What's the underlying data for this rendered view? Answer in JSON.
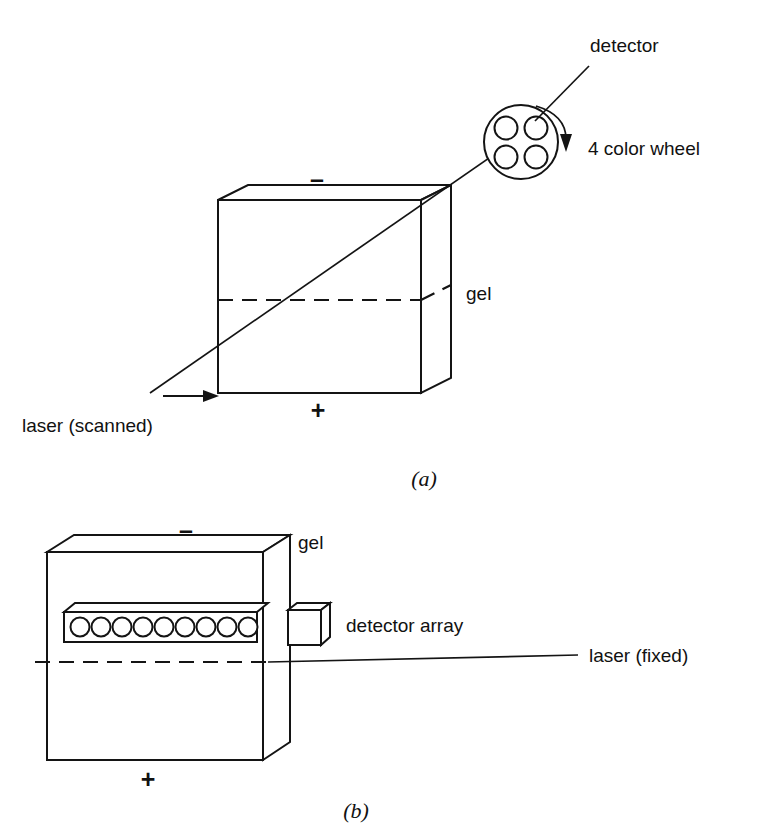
{
  "figure": {
    "background_color": "#ffffff",
    "ink_color": "#141414"
  },
  "panel_a": {
    "caption": "(a)",
    "labels": {
      "detector": "detector",
      "color_wheel": "4 color wheel",
      "gel": "gel",
      "laser": "laser (scanned)",
      "electrode_top": "–",
      "electrode_bottom": "+"
    },
    "wheel": {
      "name": "4 color wheel",
      "filter_count": 4,
      "rotation": "clockwise"
    },
    "laser": {
      "mode": "scanned",
      "scan_direction": "right"
    }
  },
  "panel_b": {
    "caption": "(b)",
    "labels": {
      "gel": "gel",
      "detector_array": "detector array",
      "laser": "laser (fixed)",
      "electrode_top": "–",
      "electrode_bottom": "+"
    },
    "detector_array": {
      "element_count": 9
    },
    "laser": {
      "mode": "fixed"
    }
  }
}
